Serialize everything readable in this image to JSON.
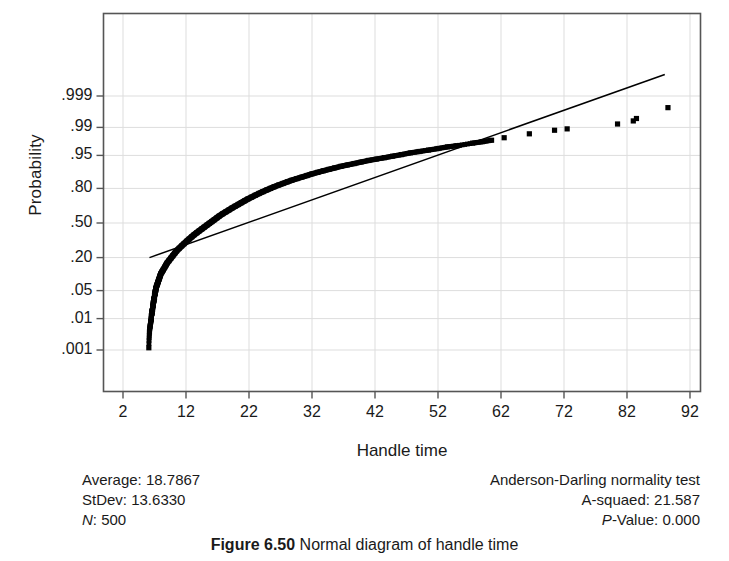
{
  "figure": {
    "caption_label": "Figure 6.50",
    "caption_text": "Normal diagram of handle time"
  },
  "axes": {
    "y_title": "Probability",
    "x_title": "Handle time",
    "y_ticks": [
      ".999",
      ".99",
      ".95",
      ".80",
      ".50",
      ".20",
      ".05",
      ".01",
      ".001"
    ],
    "x_ticks": [
      "2",
      "12",
      "22",
      "32",
      "42",
      "52",
      "62",
      "72",
      "82",
      "92"
    ]
  },
  "stats_left": {
    "average_label": "Average:",
    "average_value": "18.7867",
    "stdev_label": "StDev:",
    "stdev_value": "13.6330",
    "n_label": "N",
    "n_value": ": 500"
  },
  "stats_right": {
    "test_title": "Anderson-Darling normality test",
    "asquared_label": "A-squaed:",
    "asquared_value": "21.587",
    "pvalue_label": "P",
    "pvalue_value": "-Value: 0.000"
  },
  "colors": {
    "marker": "#000000",
    "line": "#000000",
    "frame": "#555555",
    "grid": "#dddddd",
    "text": "#1a1a1a",
    "background": "#ffffff"
  },
  "chart_data": {
    "type": "scatter",
    "title": "",
    "subtitle": "",
    "xlabel": "Handle time",
    "ylabel": "Probability",
    "xlim": [
      2,
      92
    ],
    "ylim_probability": [
      0.001,
      0.999
    ],
    "grid": true,
    "legend": "none",
    "x_tick_values": [
      2,
      12,
      22,
      32,
      42,
      52,
      62,
      72,
      82,
      92
    ],
    "y_tick_probabilities": [
      0.999,
      0.99,
      0.95,
      0.8,
      0.5,
      0.2,
      0.05,
      0.01,
      0.001
    ],
    "sample_size": 500,
    "mean": 18.7867,
    "stdev": 13.633,
    "anderson_darling_A_squared": 21.587,
    "p_value": 0.0,
    "reference_line": {
      "description": "Normal fit line through mean/stdev",
      "x_start": 6.2,
      "p_start": 0.2,
      "x_end": 88.0,
      "p_end": 0.99985
    },
    "series": [
      {
        "name": "Handle time order statistics",
        "x": [
          6.1,
          6.2,
          6.3,
          6.4,
          6.5,
          6.5,
          6.6,
          6.6,
          6.7,
          6.7,
          6.8,
          6.8,
          6.9,
          6.9,
          7.0,
          7.0,
          7.1,
          7.1,
          7.2,
          7.2,
          7.3,
          7.4,
          7.5,
          7.6,
          7.7,
          7.8,
          7.9,
          8.0,
          8.2,
          8.4,
          8.6,
          8.8,
          9.0,
          9.3,
          9.6,
          9.9,
          10.2,
          10.5,
          10.9,
          11.3,
          11.7,
          12.1,
          12.5,
          12.9,
          13.3,
          13.7,
          14.1,
          14.5,
          14.9,
          15.3,
          15.7,
          16.1,
          16.5,
          16.9,
          17.3,
          17.8,
          18.3,
          18.8,
          19.3,
          19.8,
          20.3,
          20.8,
          21.3,
          21.8,
          22.4,
          23.0,
          23.6,
          24.2,
          24.8,
          25.4,
          26.0,
          26.7,
          27.4,
          28.1,
          28.8,
          29.6,
          30.4,
          31.2,
          32.0,
          32.9,
          33.8,
          34.7,
          35.6,
          36.6,
          37.6,
          38.7,
          39.8,
          41.0,
          42.2,
          43.5,
          44.8,
          46.2,
          47.6,
          49.0,
          50.5,
          52.0,
          53.5,
          55.0,
          57.5,
          59.0,
          60.5,
          62.5,
          66.5,
          70.5,
          72.5,
          80.5,
          83.0,
          83.5,
          88.5
        ],
        "p": [
          0.0012,
          0.004,
          0.006,
          0.008,
          0.01,
          0.012,
          0.014,
          0.016,
          0.018,
          0.02,
          0.023,
          0.026,
          0.029,
          0.032,
          0.035,
          0.039,
          0.043,
          0.047,
          0.051,
          0.055,
          0.06,
          0.066,
          0.072,
          0.078,
          0.085,
          0.092,
          0.1,
          0.108,
          0.118,
          0.128,
          0.14,
          0.152,
          0.165,
          0.18,
          0.196,
          0.213,
          0.23,
          0.248,
          0.268,
          0.288,
          0.308,
          0.328,
          0.348,
          0.368,
          0.388,
          0.406,
          0.424,
          0.442,
          0.46,
          0.478,
          0.496,
          0.514,
          0.532,
          0.55,
          0.568,
          0.588,
          0.606,
          0.624,
          0.642,
          0.658,
          0.674,
          0.69,
          0.705,
          0.72,
          0.735,
          0.75,
          0.764,
          0.777,
          0.789,
          0.8,
          0.811,
          0.822,
          0.832,
          0.842,
          0.851,
          0.86,
          0.868,
          0.876,
          0.884,
          0.891,
          0.898,
          0.904,
          0.91,
          0.916,
          0.921,
          0.926,
          0.931,
          0.936,
          0.94,
          0.944,
          0.948,
          0.952,
          0.956,
          0.959,
          0.962,
          0.965,
          0.968,
          0.97,
          0.974,
          0.976,
          0.978,
          0.981,
          0.985,
          0.988,
          0.989,
          0.992,
          0.9935,
          0.9945,
          0.9975
        ]
      }
    ]
  }
}
